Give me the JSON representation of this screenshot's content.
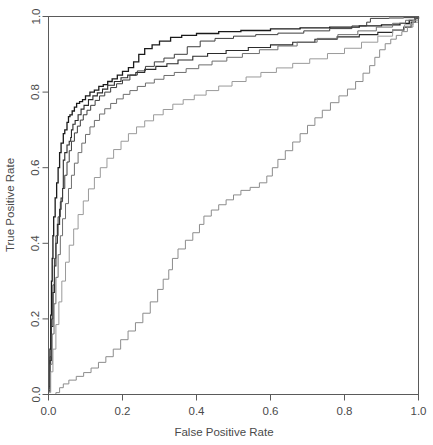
{
  "figure": {
    "title": "",
    "background_color": "#ffffff",
    "frame_color": "#5a5a5a",
    "text_color": "#4a4a4a"
  },
  "axes": {
    "x_title": "False Positive Rate",
    "y_title": "True Positive Rate",
    "x_ticks": [
      "0.0",
      "0.2",
      "0.4",
      "0.6",
      "0.8",
      "1.0"
    ],
    "y_ticks": [
      "0.0",
      "0.2",
      "0.4",
      "0.6",
      "0.8",
      "1.0"
    ]
  },
  "chart_data": {
    "type": "line",
    "title": "",
    "xlabel": "False Positive Rate",
    "ylabel": "True Positive Rate",
    "xlim": [
      0.0,
      1.0
    ],
    "ylim": [
      0.0,
      1.0
    ],
    "xticks": [
      0.0,
      0.2,
      0.4,
      0.6,
      0.8,
      1.0
    ],
    "yticks": [
      0.0,
      0.2,
      0.4,
      0.6,
      0.8,
      1.0
    ],
    "grid": false,
    "legend": "none",
    "x": [],
    "categories": [],
    "series": [
      {
        "name": "curve-1",
        "color": "#1a1a1a",
        "width": 1.3,
        "points": [
          [
            0.0,
            0.02
          ],
          [
            0.004,
            0.12
          ],
          [
            0.006,
            0.21
          ],
          [
            0.008,
            0.3
          ],
          [
            0.01,
            0.36
          ],
          [
            0.012,
            0.42
          ],
          [
            0.014,
            0.47
          ],
          [
            0.018,
            0.52
          ],
          [
            0.022,
            0.56
          ],
          [
            0.026,
            0.6
          ],
          [
            0.03,
            0.64
          ],
          [
            0.034,
            0.665
          ],
          [
            0.04,
            0.69
          ],
          [
            0.044,
            0.7
          ],
          [
            0.05,
            0.72
          ],
          [
            0.054,
            0.735
          ],
          [
            0.058,
            0.74
          ],
          [
            0.064,
            0.75
          ],
          [
            0.07,
            0.76
          ],
          [
            0.076,
            0.77
          ],
          [
            0.084,
            0.775
          ],
          [
            0.092,
            0.78
          ],
          [
            0.1,
            0.79
          ],
          [
            0.112,
            0.8
          ],
          [
            0.124,
            0.805
          ],
          [
            0.136,
            0.815
          ],
          [
            0.148,
            0.82
          ],
          [
            0.16,
            0.828
          ],
          [
            0.172,
            0.835
          ],
          [
            0.186,
            0.845
          ],
          [
            0.2,
            0.855
          ],
          [
            0.216,
            0.865
          ],
          [
            0.23,
            0.88
          ],
          [
            0.244,
            0.9
          ],
          [
            0.26,
            0.915
          ],
          [
            0.28,
            0.925
          ],
          [
            0.3,
            0.935
          ],
          [
            0.33,
            0.945
          ],
          [
            0.36,
            0.95
          ],
          [
            0.4,
            0.955
          ],
          [
            0.46,
            0.96
          ],
          [
            0.52,
            0.963
          ],
          [
            0.6,
            0.967
          ],
          [
            0.68,
            0.97
          ],
          [
            0.76,
            0.972
          ],
          [
            0.84,
            0.975
          ],
          [
            0.9,
            0.978
          ],
          [
            0.95,
            0.982
          ],
          [
            0.975,
            0.99
          ],
          [
            0.99,
            0.996
          ],
          [
            1.0,
            1.0
          ]
        ]
      },
      {
        "name": "curve-2",
        "color": "#2b2b2b",
        "width": 1.1,
        "points": [
          [
            0.0,
            0.01
          ],
          [
            0.004,
            0.09
          ],
          [
            0.008,
            0.18
          ],
          [
            0.012,
            0.27
          ],
          [
            0.016,
            0.34
          ],
          [
            0.02,
            0.4
          ],
          [
            0.024,
            0.45
          ],
          [
            0.03,
            0.49
          ],
          [
            0.034,
            0.52
          ],
          [
            0.038,
            0.545
          ],
          [
            0.04,
            0.58
          ],
          [
            0.04,
            0.62
          ],
          [
            0.044,
            0.64
          ],
          [
            0.05,
            0.66
          ],
          [
            0.056,
            0.67
          ],
          [
            0.06,
            0.68
          ],
          [
            0.062,
            0.7
          ],
          [
            0.066,
            0.715
          ],
          [
            0.072,
            0.725
          ],
          [
            0.08,
            0.74
          ],
          [
            0.088,
            0.755
          ],
          [
            0.096,
            0.765
          ],
          [
            0.108,
            0.78
          ],
          [
            0.12,
            0.79
          ],
          [
            0.132,
            0.798
          ],
          [
            0.146,
            0.808
          ],
          [
            0.16,
            0.818
          ],
          [
            0.178,
            0.828
          ],
          [
            0.196,
            0.838
          ],
          [
            0.214,
            0.845
          ],
          [
            0.236,
            0.852
          ],
          [
            0.26,
            0.86
          ],
          [
            0.29,
            0.868
          ],
          [
            0.32,
            0.875
          ],
          [
            0.35,
            0.885
          ],
          [
            0.39,
            0.895
          ],
          [
            0.43,
            0.902
          ],
          [
            0.48,
            0.91
          ],
          [
            0.54,
            0.918
          ],
          [
            0.6,
            0.925
          ],
          [
            0.66,
            0.932
          ],
          [
            0.72,
            0.94
          ],
          [
            0.78,
            0.946
          ],
          [
            0.84,
            0.952
          ],
          [
            0.89,
            0.958
          ],
          [
            0.93,
            0.964
          ],
          [
            0.96,
            0.972
          ],
          [
            0.98,
            0.985
          ],
          [
            0.992,
            0.994
          ],
          [
            1.0,
            1.0
          ]
        ]
      },
      {
        "name": "curve-3",
        "color": "#3d3d3d",
        "width": 1.0,
        "points": [
          [
            0.0,
            0.015
          ],
          [
            0.004,
            0.1
          ],
          [
            0.008,
            0.2
          ],
          [
            0.012,
            0.29
          ],
          [
            0.016,
            0.36
          ],
          [
            0.02,
            0.42
          ],
          [
            0.026,
            0.47
          ],
          [
            0.032,
            0.51
          ],
          [
            0.038,
            0.545
          ],
          [
            0.044,
            0.58
          ],
          [
            0.05,
            0.615
          ],
          [
            0.056,
            0.645
          ],
          [
            0.062,
            0.67
          ],
          [
            0.07,
            0.692
          ],
          [
            0.078,
            0.71
          ],
          [
            0.086,
            0.726
          ],
          [
            0.094,
            0.74
          ],
          [
            0.104,
            0.752
          ],
          [
            0.114,
            0.765
          ],
          [
            0.126,
            0.778
          ],
          [
            0.138,
            0.79
          ],
          [
            0.152,
            0.8
          ],
          [
            0.168,
            0.812
          ],
          [
            0.184,
            0.822
          ],
          [
            0.2,
            0.832
          ],
          [
            0.22,
            0.845
          ],
          [
            0.24,
            0.856
          ],
          [
            0.262,
            0.868
          ],
          [
            0.286,
            0.88
          ],
          [
            0.312,
            0.89
          ],
          [
            0.34,
            0.9
          ],
          [
            0.375,
            0.92
          ],
          [
            0.41,
            0.935
          ],
          [
            0.45,
            0.942
          ],
          [
            0.5,
            0.948
          ],
          [
            0.56,
            0.952
          ],
          [
            0.62,
            0.956
          ],
          [
            0.69,
            0.962
          ],
          [
            0.76,
            0.968
          ],
          [
            0.82,
            0.975
          ],
          [
            0.86,
            0.985
          ],
          [
            0.87,
            0.995
          ],
          [
            0.92,
            0.996
          ],
          [
            0.96,
            0.997
          ],
          [
            1.0,
            1.0
          ]
        ]
      },
      {
        "name": "curve-4",
        "color": "#6e6e6e",
        "width": 1.0,
        "points": [
          [
            0.0,
            0.008
          ],
          [
            0.005,
            0.08
          ],
          [
            0.01,
            0.16
          ],
          [
            0.015,
            0.24
          ],
          [
            0.02,
            0.31
          ],
          [
            0.026,
            0.37
          ],
          [
            0.032,
            0.42
          ],
          [
            0.038,
            0.465
          ],
          [
            0.046,
            0.505
          ],
          [
            0.054,
            0.545
          ],
          [
            0.062,
            0.58
          ],
          [
            0.07,
            0.612
          ],
          [
            0.08,
            0.64
          ],
          [
            0.09,
            0.665
          ],
          [
            0.1,
            0.688
          ],
          [
            0.112,
            0.708
          ],
          [
            0.124,
            0.725
          ],
          [
            0.138,
            0.742
          ],
          [
            0.152,
            0.756
          ],
          [
            0.168,
            0.77
          ],
          [
            0.184,
            0.782
          ],
          [
            0.202,
            0.794
          ],
          [
            0.22,
            0.804
          ],
          [
            0.24,
            0.815
          ],
          [
            0.262,
            0.824
          ],
          [
            0.286,
            0.834
          ],
          [
            0.312,
            0.844
          ],
          [
            0.34,
            0.852
          ],
          [
            0.372,
            0.862
          ],
          [
            0.406,
            0.872
          ],
          [
            0.442,
            0.882
          ],
          [
            0.482,
            0.892
          ],
          [
            0.524,
            0.902
          ],
          [
            0.57,
            0.912
          ],
          [
            0.62,
            0.922
          ],
          [
            0.672,
            0.932
          ],
          [
            0.726,
            0.942
          ],
          [
            0.782,
            0.952
          ],
          [
            0.836,
            0.962
          ],
          [
            0.886,
            0.972
          ],
          [
            0.93,
            0.982
          ],
          [
            0.965,
            0.99
          ],
          [
            0.99,
            0.996
          ],
          [
            1.0,
            1.0
          ]
        ]
      },
      {
        "name": "curve-5",
        "color": "#9a9a9a",
        "width": 1.0,
        "points": [
          [
            0.0,
            0.005
          ],
          [
            0.006,
            0.06
          ],
          [
            0.012,
            0.12
          ],
          [
            0.02,
            0.185
          ],
          [
            0.028,
            0.245
          ],
          [
            0.036,
            0.3
          ],
          [
            0.046,
            0.35
          ],
          [
            0.056,
            0.395
          ],
          [
            0.068,
            0.438
          ],
          [
            0.08,
            0.476
          ],
          [
            0.094,
            0.512
          ],
          [
            0.108,
            0.544
          ],
          [
            0.124,
            0.574
          ],
          [
            0.14,
            0.6
          ],
          [
            0.158,
            0.625
          ],
          [
            0.176,
            0.648
          ],
          [
            0.196,
            0.67
          ],
          [
            0.216,
            0.69
          ],
          [
            0.238,
            0.708
          ],
          [
            0.26,
            0.724
          ],
          [
            0.284,
            0.74
          ],
          [
            0.31,
            0.754
          ],
          [
            0.336,
            0.768
          ],
          [
            0.364,
            0.78
          ],
          [
            0.394,
            0.792
          ],
          [
            0.426,
            0.804
          ],
          [
            0.46,
            0.816
          ],
          [
            0.496,
            0.828
          ],
          [
            0.534,
            0.84
          ],
          [
            0.574,
            0.852
          ],
          [
            0.616,
            0.864
          ],
          [
            0.66,
            0.876
          ],
          [
            0.706,
            0.888
          ],
          [
            0.754,
            0.902
          ],
          [
            0.8,
            0.916
          ],
          [
            0.846,
            0.932
          ],
          [
            0.89,
            0.948
          ],
          [
            0.93,
            0.964
          ],
          [
            0.962,
            0.978
          ],
          [
            0.985,
            0.99
          ],
          [
            1.0,
            1.0
          ]
        ]
      },
      {
        "name": "curve-6",
        "color": "#8c8c8c",
        "width": 1.0,
        "points": [
          [
            0.0,
            0.0
          ],
          [
            0.02,
            0.005
          ],
          [
            0.03,
            0.018
          ],
          [
            0.04,
            0.028
          ],
          [
            0.055,
            0.038
          ],
          [
            0.075,
            0.048
          ],
          [
            0.095,
            0.058
          ],
          [
            0.115,
            0.07
          ],
          [
            0.135,
            0.085
          ],
          [
            0.155,
            0.1
          ],
          [
            0.175,
            0.12
          ],
          [
            0.195,
            0.145
          ],
          [
            0.215,
            0.168
          ],
          [
            0.235,
            0.19
          ],
          [
            0.255,
            0.215
          ],
          [
            0.275,
            0.245
          ],
          [
            0.295,
            0.278
          ],
          [
            0.31,
            0.305
          ],
          [
            0.325,
            0.33
          ],
          [
            0.335,
            0.36
          ],
          [
            0.35,
            0.385
          ],
          [
            0.37,
            0.408
          ],
          [
            0.39,
            0.428
          ],
          [
            0.408,
            0.45
          ],
          [
            0.42,
            0.472
          ],
          [
            0.44,
            0.488
          ],
          [
            0.46,
            0.502
          ],
          [
            0.48,
            0.515
          ],
          [
            0.5,
            0.528
          ],
          [
            0.52,
            0.54
          ],
          [
            0.545,
            0.548
          ],
          [
            0.57,
            0.56
          ],
          [
            0.59,
            0.578
          ],
          [
            0.605,
            0.6
          ],
          [
            0.62,
            0.622
          ],
          [
            0.64,
            0.645
          ],
          [
            0.66,
            0.668
          ],
          [
            0.68,
            0.69
          ],
          [
            0.7,
            0.712
          ],
          [
            0.72,
            0.732
          ],
          [
            0.74,
            0.752
          ],
          [
            0.762,
            0.772
          ],
          [
            0.785,
            0.79
          ],
          [
            0.808,
            0.808
          ],
          [
            0.83,
            0.828
          ],
          [
            0.85,
            0.85
          ],
          [
            0.868,
            0.87
          ],
          [
            0.882,
            0.892
          ],
          [
            0.895,
            0.912
          ],
          [
            0.91,
            0.928
          ],
          [
            0.925,
            0.94
          ],
          [
            0.94,
            0.95
          ],
          [
            0.955,
            0.96
          ],
          [
            0.97,
            0.972
          ],
          [
            0.985,
            0.985
          ],
          [
            1.0,
            1.0
          ]
        ]
      }
    ]
  }
}
